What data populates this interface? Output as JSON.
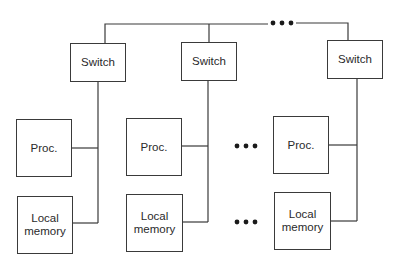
{
  "diagram": {
    "type": "distributed-memory multiprocessor",
    "ellipsis": "•••",
    "nodes": [
      {
        "switch_label": "Switch",
        "proc_label": "Proc.",
        "memory_label": "Local\nmemory"
      },
      {
        "switch_label": "Switch",
        "proc_label": "Proc.",
        "memory_label": "Local\nmemory"
      },
      {
        "switch_label": "Switch",
        "proc_label": "Proc.",
        "memory_label": "Local\nmemory"
      }
    ],
    "colors": {
      "line": "#3a3a3a",
      "background": "#ffffff"
    }
  }
}
